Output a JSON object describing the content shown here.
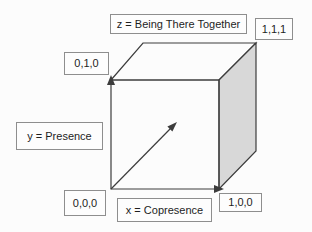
{
  "colors": {
    "background": "#fcfcfc",
    "line": "#3c3c3c",
    "face-shade": "#d8d8d8",
    "box-border": "#8e8e8e",
    "box-bg": "#fdfdfd",
    "text": "#1e1e1e"
  },
  "diagram": {
    "type": "cube-axes-diagram",
    "axes": {
      "z_label": "z = Being There Together",
      "y_label": "y = Presence",
      "x_label": "x = Copresence"
    },
    "vertices": {
      "origin": "0,0,0",
      "unit_x": "1,0,0",
      "unit_y": "0,1,0",
      "unit_xyz": "1,1,1"
    }
  }
}
